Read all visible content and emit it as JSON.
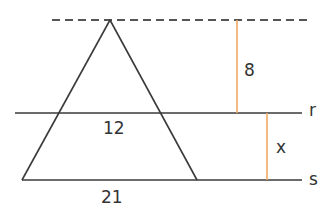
{
  "diagram": {
    "type": "geometry-parallel-lines-similar-triangles",
    "colors": {
      "line": "#3a3a3a",
      "dashed": "#555555",
      "measure": "#f0a860",
      "text": "#333333"
    },
    "labels": {
      "height_top": "8",
      "height_bottom": "x",
      "segment_on_r": "12",
      "segment_on_s": "21",
      "line_r": "r",
      "line_s": "s"
    },
    "lines": [
      {
        "name": "dashed-top-line",
        "style": "dashed",
        "through": "apex"
      },
      {
        "name": "r",
        "style": "solid"
      },
      {
        "name": "s",
        "style": "solid"
      }
    ],
    "measurements": [
      {
        "name": "distance-apex-to-r",
        "value": "8"
      },
      {
        "name": "distance-r-to-s",
        "value": "x"
      }
    ]
  }
}
